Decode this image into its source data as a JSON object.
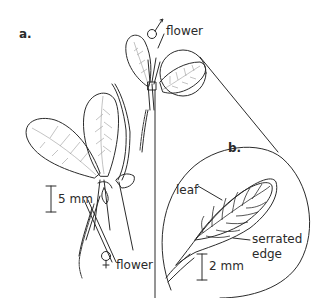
{
  "figure": {
    "panel_a": {
      "label": "a."
    },
    "panel_b": {
      "label": "b."
    },
    "labels": {
      "male_flower": {
        "symbol": "♂",
        "text": "flower"
      },
      "female_flower": {
        "symbol": "♀",
        "text": "flower"
      },
      "leaf": "leaf",
      "serrated_edge_line1": "serrated",
      "serrated_edge_line2": "edge"
    },
    "scale_bars": {
      "a": "5 mm",
      "b": "2 mm"
    },
    "colors": {
      "ink": "#2b2b2b",
      "vein": "#9a9a9a",
      "background": "#ffffff"
    }
  }
}
